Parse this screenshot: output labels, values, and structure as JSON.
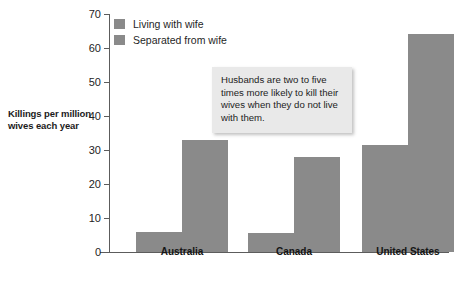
{
  "axis": {
    "y_label": "Killings per million wives each year",
    "y_ticks": [
      "0",
      "10",
      "20",
      "30",
      "40",
      "50",
      "60",
      "70"
    ]
  },
  "legend": {
    "items": [
      {
        "label": "Living with wife",
        "swatch": "legend-swatch-living-with-wife",
        "color": "#8a8a8a"
      },
      {
        "label": "Separated from wife",
        "swatch": "legend-swatch-separated-from-wife",
        "color": "#8a8a8a"
      }
    ]
  },
  "annotation": {
    "text": "Husbands are two to five times more likely to kill their wives when they do not live with them."
  },
  "categories": [
    "Australia",
    "Canada",
    "United States"
  ],
  "chart_data": {
    "type": "bar",
    "title": "",
    "xlabel": "",
    "ylabel": "Killings per million wives each year",
    "ylim": [
      0,
      70
    ],
    "ytick_step": 10,
    "grid": false,
    "legend_position": "top-left",
    "bar_color": "#8a8a8a",
    "categories": [
      "Australia",
      "Canada",
      "United States"
    ],
    "series": [
      {
        "name": "Living with wife",
        "values": [
          6,
          5.7,
          31.5
        ]
      },
      {
        "name": "Separated from wife",
        "values": [
          33,
          28,
          64
        ]
      }
    ],
    "annotations": [
      {
        "text": "Husbands are two to five times more likely to kill their wives when they do not live with them.",
        "style": "gray-callout-box"
      }
    ]
  }
}
